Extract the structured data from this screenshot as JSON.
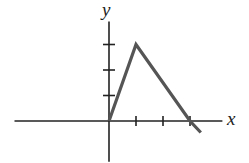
{
  "chart_data": {
    "type": "line",
    "title": "",
    "xlabel": "x",
    "ylabel": "y",
    "x": [
      0,
      1,
      3,
      3.4
    ],
    "series": [
      {
        "name": "piecewise linear graph",
        "values": [
          0,
          3,
          0,
          -0.45
        ]
      }
    ],
    "x_ticks": [
      1,
      2,
      3
    ],
    "y_ticks": [
      1,
      2,
      3
    ],
    "tick_labels_shown": false,
    "xlim": [
      -3.5,
      4.2
    ],
    "ylim": [
      -1.6,
      3.9
    ],
    "grid": false,
    "legend": null,
    "colors": {
      "line": "#555555",
      "axes": "#222222",
      "background": "#ffffff"
    }
  },
  "labels": {
    "x_axis": "x",
    "y_axis": "y"
  }
}
